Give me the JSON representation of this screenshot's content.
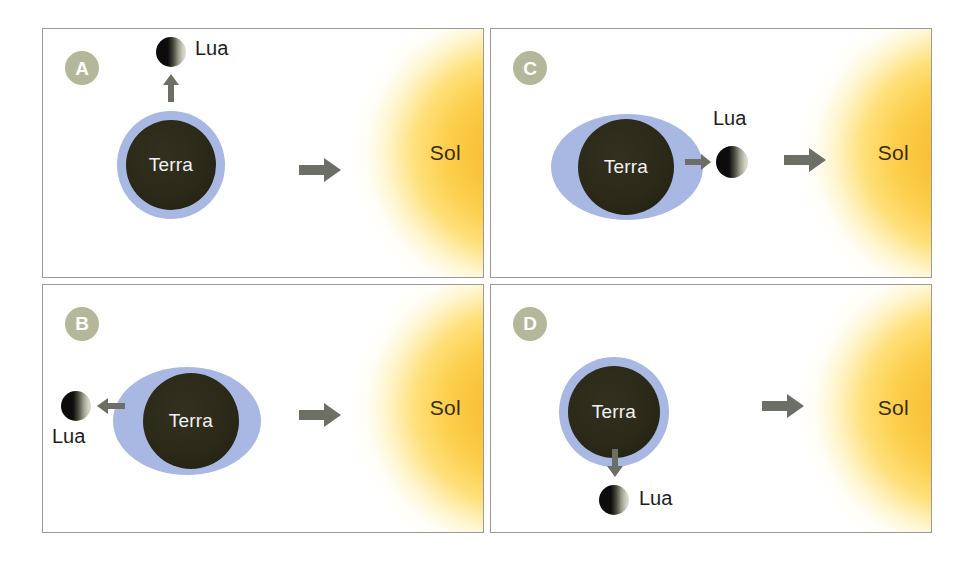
{
  "figure": {
    "colors": {
      "earth_body": "#2b2918",
      "earth_halo": "#a9b8e2",
      "sun_core": "#f7b32a",
      "sun_mid": "#fccf4d",
      "badge_bg": "#b5b79a",
      "arrow_gray": "#6c6f66",
      "panel_border": "#9a9a9a"
    },
    "labels": {
      "earth": "Terra",
      "moon": "Lua",
      "sun": "Sol"
    }
  },
  "panels": [
    {
      "id": "A",
      "badge": "A",
      "earth_label": "Terra",
      "moon_label": "Lua",
      "sun_label": "Sol",
      "moon_position": "above-earth",
      "moon_arrow_direction": "up",
      "sun_arrow_direction": "right",
      "phase": "first-quarter",
      "description": "Lua acima da Terra, seta apontando para cima"
    },
    {
      "id": "B",
      "badge": "B",
      "earth_label": "Terra",
      "moon_label": "Lua",
      "sun_label": "Sol",
      "moon_position": "left-of-earth",
      "moon_arrow_direction": "left",
      "sun_arrow_direction": "right",
      "phase": "full-moon",
      "description": "Lua a esquerda da Terra, lado oposto ao Sol"
    },
    {
      "id": "C",
      "badge": "C",
      "earth_label": "Terra",
      "moon_label": "Lua",
      "sun_label": "Sol",
      "moon_position": "right-of-earth",
      "moon_arrow_direction": "right",
      "sun_arrow_direction": "right",
      "phase": "new-moon",
      "description": "Lua entre a Terra e o Sol"
    },
    {
      "id": "D",
      "badge": "D",
      "earth_label": "Terra",
      "moon_label": "Lua",
      "sun_label": "Sol",
      "moon_position": "below-earth",
      "moon_arrow_direction": "down",
      "sun_arrow_direction": "right",
      "phase": "last-quarter",
      "description": "Lua abaixo da Terra, seta apontando para baixo"
    }
  ]
}
